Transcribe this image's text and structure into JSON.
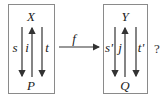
{
  "diagram": {
    "left_box": {
      "top": "X",
      "bottom": "P",
      "arrows": [
        {
          "label": "s",
          "direction": "down"
        },
        {
          "label": "i",
          "direction": "up"
        },
        {
          "label": "t",
          "direction": "down"
        }
      ]
    },
    "connector": {
      "label": "f",
      "direction": "right"
    },
    "right_box": {
      "top": "Y",
      "bottom": "Q",
      "arrows": [
        {
          "label": "s'",
          "direction": "down"
        },
        {
          "label": "j",
          "direction": "up"
        },
        {
          "label": "t'",
          "direction": "down"
        }
      ]
    },
    "question_mark": "?",
    "colors": {
      "line": "#333333",
      "box": "#888888"
    }
  }
}
